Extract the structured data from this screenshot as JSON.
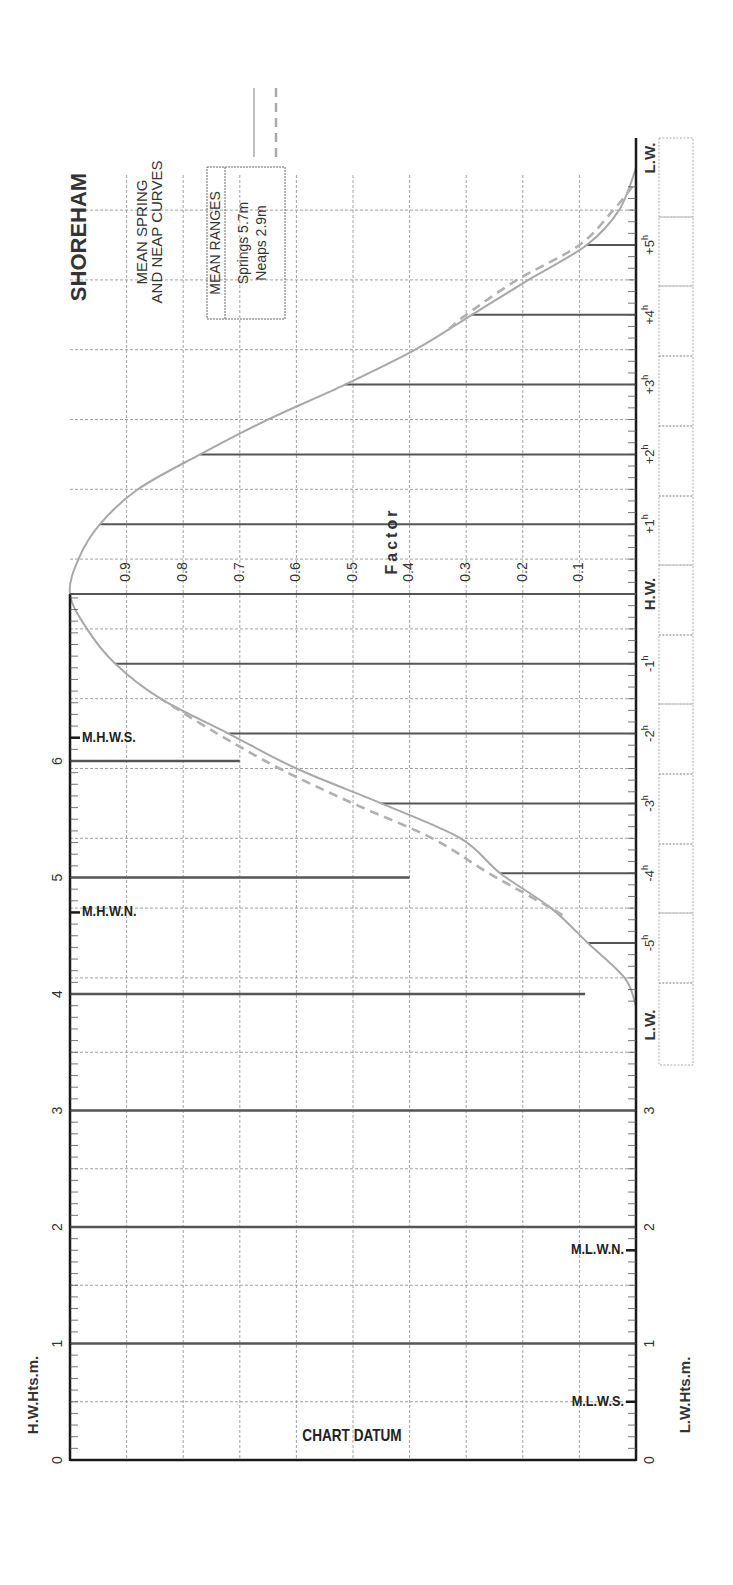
{
  "title": "SHOREHAM",
  "subtitle_line1": "MEAN SPRING",
  "subtitle_line2": "AND NEAP CURVES",
  "legend": {
    "header": "MEAN RANGES",
    "springs_label": "Springs",
    "springs_value": "5.7m",
    "neaps_label": "Neaps",
    "neaps_value": "2.9m"
  },
  "axis_labels": {
    "factor": "Factor",
    "hw_heights": "H.W.Hts.m.",
    "lw_heights": "L.W.Hts.m.",
    "chart_datum": "CHART DATUM",
    "hw": "H.W.",
    "lw_top": "L.W.",
    "lw_bottom": "L.W."
  },
  "level_markers": {
    "mhws": "M.H.W.S.",
    "mhwn": "M.H.W.N.",
    "mlwn": "M.L.W.N.",
    "mlws": "M.L.W.S."
  },
  "colors": {
    "axis": "#1a1a1a",
    "grid": "#8a8a8a",
    "hour_line": "#555555",
    "height_bar": "#555555",
    "spring_curve": "#a8a8a8",
    "neap_curve": "#b0b0b0",
    "text": "#333333"
  },
  "chart_data": {
    "type": "line",
    "title": "SHOREHAM",
    "subtitle": "MEAN SPRING AND NEAP CURVES",
    "orientation": "rotated 90° (time runs vertically, factor horizontally)",
    "xlabel": "Time from H.W. (hours)",
    "ylabel": "Factor",
    "factor_ticks": [
      "0.9",
      "0.8",
      "0.7",
      "0.6",
      "0.5",
      "0.4",
      "0.3",
      "0.2",
      "0.1"
    ],
    "time_ticks_after_hw": [
      "+1h",
      "+2h",
      "+3h",
      "+4h",
      "+5h"
    ],
    "time_ticks_before_hw": [
      "-1h",
      "-2h",
      "-3h",
      "-4h",
      "-5h"
    ],
    "height_ticks_m": [
      "0",
      "1",
      "2",
      "3",
      "4",
      "5",
      "6"
    ],
    "height_range_m": [
      0,
      7.4
    ],
    "factor_range": [
      0,
      1
    ],
    "levels_m": {
      "MHWS": 6.2,
      "MHWN": 4.7,
      "MLWN": 1.8,
      "MLWS": 0.5
    },
    "mean_ranges_m": {
      "springs": 5.7,
      "neaps": 2.9
    },
    "series": [
      {
        "name": "Springs",
        "style": "solid",
        "x_hours": [
          -5.9,
          -5.5,
          -5,
          -4.5,
          -4,
          -3.5,
          -3,
          -2.5,
          -2,
          -1.5,
          -1,
          -0.5,
          0,
          0.5,
          1,
          1.5,
          2,
          2.5,
          3,
          3.5,
          4,
          4.5,
          5,
          5.5,
          6.1
        ],
        "factor": [
          0.0,
          0.02,
          0.085,
          0.15,
          0.24,
          0.31,
          0.45,
          0.6,
          0.72,
          0.84,
          0.92,
          0.97,
          1.0,
          0.985,
          0.947,
          0.88,
          0.77,
          0.65,
          0.514,
          0.39,
          0.29,
          0.19,
          0.087,
          0.03,
          0.0
        ]
      },
      {
        "name": "Neaps",
        "style": "dashed",
        "x_hours": [
          -4.6,
          -4.5,
          -4,
          -3.5,
          -3,
          -2.5,
          -2,
          -1.5
        ],
        "factor": [
          0.13,
          0.15,
          0.26,
          0.36,
          0.5,
          0.63,
          0.74,
          0.84
        ],
        "x_hours_after": [
          3.8,
          4,
          4.5,
          5,
          5.5,
          5.9
        ],
        "factor_after": [
          0.33,
          0.3,
          0.21,
          0.1,
          0.04,
          0.0
        ]
      }
    ],
    "height_bars": [
      {
        "height_m": 6,
        "extends_to_factor": 0.7
      },
      {
        "height_m": 5,
        "extends_to_factor": 0.4
      },
      {
        "height_m": 4,
        "extends_to_factor": 0.09
      },
      {
        "height_m": 3,
        "extends_to_factor": 0.0
      },
      {
        "height_m": 2,
        "extends_to_factor": 0.0
      },
      {
        "height_m": 1,
        "extends_to_factor": 0.0
      }
    ],
    "grid": true,
    "legend_position": "top"
  }
}
